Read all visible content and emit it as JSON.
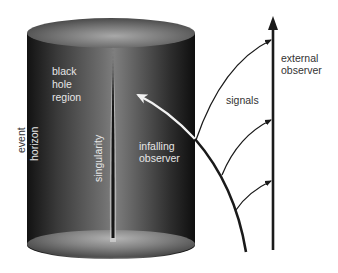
{
  "diagram": {
    "labels": {
      "event": "event",
      "horizon": "horizon",
      "black_hole_region_lines": [
        "black",
        "hole",
        "region"
      ],
      "singularity": "singularity",
      "infalling_observer_lines": [
        "infalling",
        "observer"
      ],
      "signals": "signals",
      "external_observer_lines": [
        "external",
        "observer"
      ]
    },
    "elements": {
      "cylinder": "event-horizon-cylinder",
      "singularity_line": "central-singularity",
      "infalling_worldline": "curved-black-worldline-with-white-arrow-inside-horizon",
      "external_worldline": "vertical-arrow",
      "signal_arrows": 3
    },
    "colors": {
      "background": "#ffffff",
      "cylinder_edge": "#141414",
      "cylinder_center": "#7c7c7c",
      "top_ellipse_center": "#9a9a9a",
      "line": "#1a1a1a",
      "inner_arrow": "#f2f2f2",
      "label_inside": "#e6e6e6",
      "label_outside": "#333333"
    }
  }
}
